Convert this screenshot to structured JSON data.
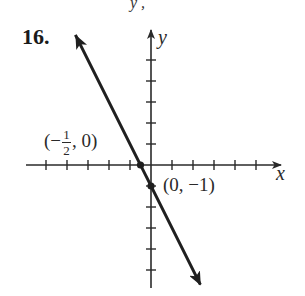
{
  "problem": {
    "number": "16.",
    "top_fragment": "y  ,"
  },
  "chart_data": {
    "type": "line",
    "title": "",
    "xlabel": "x",
    "ylabel": "y",
    "equation": "y = -2x - 1",
    "xlim": [
      -5,
      5
    ],
    "ylim": [
      -5,
      5
    ],
    "x_ticks": [
      -5,
      -4,
      -3,
      -2,
      -1,
      1,
      2,
      3,
      4,
      5
    ],
    "y_ticks": [
      -5,
      -4,
      -3,
      -2,
      -1,
      1,
      2,
      3,
      4,
      5
    ],
    "tick_labels_shown": false,
    "grid": false,
    "series": [
      {
        "name": "line",
        "slope": -2,
        "intercept": -1,
        "x": [
          -3.6,
          2.35
        ],
        "y": [
          6.2,
          -5.7
        ],
        "arrows_both_ends": true
      }
    ],
    "points": [
      {
        "x": -0.5,
        "y": 0,
        "label_prefix": "(−",
        "label_num": "1",
        "label_den": "2",
        "label_suffix": ", 0)"
      },
      {
        "x": 0,
        "y": -1,
        "label": "(0, −1)"
      }
    ],
    "color": "#1f1f1f"
  },
  "layout": {
    "origin_px": [
      151,
      165
    ],
    "unit_px": 21
  }
}
